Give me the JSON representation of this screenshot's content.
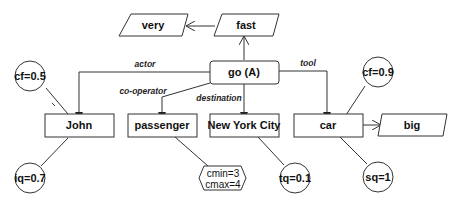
{
  "diagram": {
    "type": "conceptual-graph",
    "nodes": {
      "go": "go (A)",
      "very": "very",
      "fast": "fast",
      "john": "John",
      "passenger": "passenger",
      "nyc": "New York City",
      "car": "car",
      "big": "big",
      "cf_john": "cf=0.5",
      "iq_john": "iq=0.7",
      "cmin": "cmin=3",
      "cmax": "cmax=4",
      "tq_nyc": "tq=0.1",
      "cf_car": "cf=0.9",
      "sq_car": "sq=1"
    },
    "edges": {
      "actor": "actor",
      "co_operator": "co-operator",
      "destination": "destination",
      "tool": "tool"
    }
  }
}
